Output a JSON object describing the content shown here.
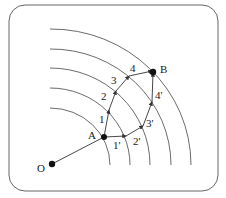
{
  "diagram": {
    "title": "",
    "points": {
      "O": {
        "label": "O"
      },
      "A": {
        "label": "A"
      },
      "B": {
        "label": "B"
      }
    },
    "path_upper_labels": [
      "1",
      "2",
      "3",
      "4"
    ],
    "path_lower_labels": [
      "1'",
      "2'",
      "3'",
      "4'"
    ],
    "colors": {
      "line": "#333333",
      "frame": "#555555",
      "background": "#ffffff"
    }
  }
}
